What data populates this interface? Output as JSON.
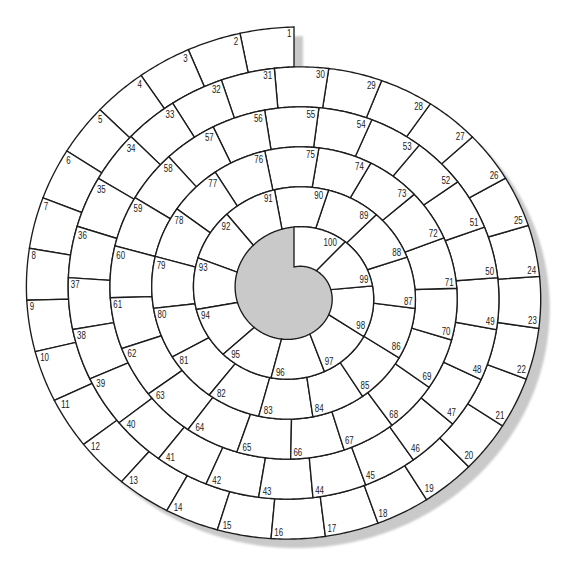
{
  "board": {
    "cells": [
      "1",
      "2",
      "3",
      "4",
      "5",
      "6",
      "7",
      "8",
      "9",
      "10",
      "11",
      "12",
      "13",
      "14",
      "15",
      "16",
      "17",
      "18",
      "19",
      "20",
      "21",
      "22",
      "23",
      "24",
      "25",
      "26",
      "27",
      "28",
      "29",
      "30",
      "31",
      "32",
      "33",
      "34",
      "35",
      "36",
      "37",
      "38",
      "39",
      "40",
      "41",
      "42",
      "43",
      "44",
      "45",
      "46",
      "47",
      "48",
      "49",
      "50",
      "51",
      "52",
      "53",
      "54",
      "55",
      "56",
      "57",
      "58",
      "59",
      "60",
      "61",
      "62",
      "63",
      "64",
      "65",
      "66",
      "67",
      "68",
      "69",
      "70",
      "71",
      "72",
      "73",
      "74",
      "75",
      "76",
      "77",
      "78",
      "79",
      "80",
      "81",
      "82",
      "83",
      "84",
      "85",
      "86",
      "87",
      "88",
      "89",
      "90",
      "91",
      "92",
      "93",
      "94",
      "95",
      "96",
      "97",
      "98",
      "99",
      "100"
    ]
  },
  "colors": {
    "background": "#ffffff",
    "cell_fill": "#ffffff",
    "line": "#1c1c1c",
    "label": "#1a1a1a",
    "shadow": "#c9c9c9"
  }
}
